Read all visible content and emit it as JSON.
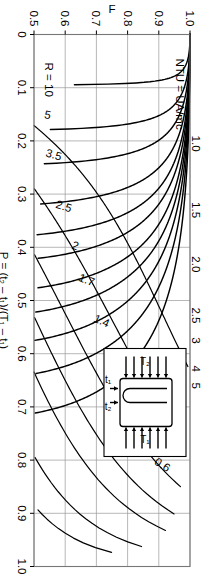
{
  "figure": {
    "orientation": "rotated-90",
    "background": "#ffffff",
    "ink": "#000000",
    "grid_color": "#9a9a9a",
    "inset": {
      "label_T1": "T₁",
      "label_T2": "T₂",
      "label_t1": "t₁",
      "label_t2": "t₂",
      "description": "1-2 shell-and-tube heat exchanger schematic"
    }
  },
  "chart_data": {
    "type": "line",
    "title": "",
    "xlabel": "P = (t₂ – t₁)/(T₁ – t₁)",
    "ylabel": "F",
    "secondary_label": "NTU = UA/mc",
    "xlim": [
      0,
      1.0
    ],
    "ylim": [
      0.5,
      1.0
    ],
    "grid": true,
    "legend": "inline-curve-labels",
    "x_ticks": [
      "0",
      "0.1",
      "0.2",
      "0.3",
      "0.4",
      "0.5",
      "0.6",
      "0.7",
      "0.8",
      "0.9",
      "1.0"
    ],
    "x_tick_values": [
      0,
      0.1,
      0.2,
      0.3,
      0.4,
      0.5,
      0.6,
      0.7,
      0.8,
      0.9,
      1.0
    ],
    "y_ticks": [
      "0.5",
      "0.6",
      "0.7",
      "0.8",
      "0.9",
      "1.0"
    ],
    "y_tick_values": [
      0.5,
      0.6,
      0.7,
      0.8,
      0.9,
      1.0
    ],
    "ntu_ticks": [
      "1.0",
      "1.5",
      "2.0",
      "2.5",
      "3",
      "4",
      "5"
    ],
    "ntu_tick_values": [
      1.0,
      1.5,
      2.0,
      2.5,
      3.0,
      4.0,
      5.0
    ],
    "r_curve_labels": [
      "0.6",
      "0.8",
      "1",
      "1.2",
      "1.4",
      "1.7",
      "2",
      "2.5",
      "3.5",
      "5",
      "R = 10"
    ],
    "r_curve_values": [
      0.6,
      0.8,
      1.0,
      1.2,
      1.4,
      1.7,
      2.0,
      2.5,
      3.5,
      5.0,
      10.0
    ],
    "series": [
      {
        "name": "R = 0.6",
        "r": 0.6,
        "p_end": 0.975,
        "f_end": 0.5
      },
      {
        "name": "R = 0.8",
        "r": 0.8,
        "p_end": 0.895,
        "f_end": 0.5
      },
      {
        "name": "R = 1",
        "r": 1.0,
        "p_end": 0.84,
        "f_end": 0.5
      },
      {
        "name": "R = 1.2",
        "r": 1.2,
        "p_end": 0.78,
        "f_end": 0.5
      },
      {
        "name": "R = 1.4",
        "r": 1.4,
        "p_end": 0.72,
        "f_end": 0.5
      },
      {
        "name": "R = 1.7",
        "r": 1.7,
        "p_end": 0.64,
        "f_end": 0.5
      },
      {
        "name": "R = 2",
        "r": 2.0,
        "p_end": 0.56,
        "f_end": 0.5
      },
      {
        "name": "R = 2.5",
        "r": 2.5,
        "p_end": 0.465,
        "f_end": 0.5
      },
      {
        "name": "R = 3.5",
        "r": 3.5,
        "p_end": 0.335,
        "f_end": 0.5
      },
      {
        "name": "R = 5",
        "r": 5.0,
        "p_end": 0.235,
        "f_end": 0.5
      },
      {
        "name": "R = 10",
        "r": 10.0,
        "p_end": 0.118,
        "f_end": 0.5
      }
    ],
    "ntu_series": [
      {
        "name": "NTU = 1.0",
        "ntu": 1.0
      },
      {
        "name": "NTU = 1.5",
        "ntu": 1.5
      },
      {
        "name": "NTU = 2.0",
        "ntu": 2.0
      },
      {
        "name": "NTU = 2.5",
        "ntu": 2.5
      },
      {
        "name": "NTU = 3",
        "ntu": 3.0
      },
      {
        "name": "NTU = 4",
        "ntu": 4.0
      },
      {
        "name": "NTU = 5",
        "ntu": 5.0
      }
    ]
  }
}
